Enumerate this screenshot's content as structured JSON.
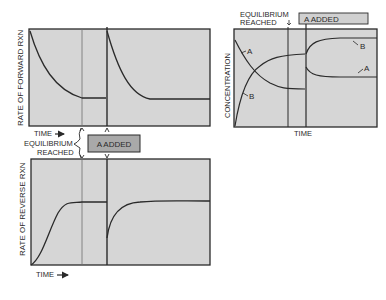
{
  "colors": {
    "panel_fill": "#d6d6d6",
    "panel_stroke": "#2a2a2a",
    "curve": "#2a2a2a",
    "added_box_fill": "#a9a9a9",
    "added_box_fill_right": "#d0d0d0",
    "thin_line": "#6e6e6e"
  },
  "left": {
    "top_panel": {
      "ylabel": "RATE OF FORWARD RXN",
      "xlabel": "TIME"
    },
    "bottom_panel": {
      "ylabel": "RATE OF REVERSE RXN",
      "xlabel": "TIME"
    },
    "equilibrium_label_1": "EQUILIBRIUM",
    "equilibrium_label_2": "REACHED",
    "added_label": "A ADDED",
    "time_arrow": "→"
  },
  "right": {
    "ylabel": "CONCENTRATION",
    "xlabel": "TIME",
    "equilibrium_label_1": "EQUILIBRIUM",
    "equilibrium_label_2": "REACHED",
    "added_label": "A ADDED",
    "curve_labels": {
      "a_before": "A",
      "b_before": "B",
      "b_after": "B",
      "a_after": "A"
    }
  }
}
